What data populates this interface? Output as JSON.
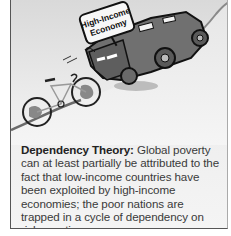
{
  "figure": {
    "illustration": {
      "sign_text_line1": "High-Income",
      "sign_text_line2": "Economy",
      "vehicle": "suv-icon",
      "bicycle": "bicycle-icon"
    },
    "caption": {
      "term": "Dependency Theory:",
      "text": " Global poverty can at least partially be attributed to the fact that low-income countries have been exploited by high-income economies; the poor nations are trapped in a cycle of dependency on richer nations."
    }
  }
}
